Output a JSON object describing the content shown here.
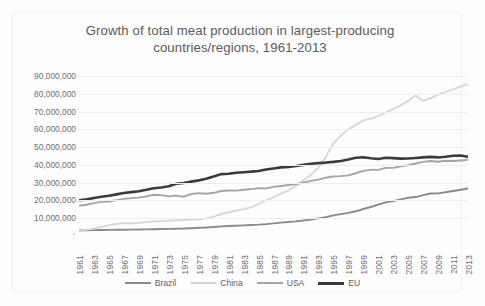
{
  "chart_data": {
    "type": "line",
    "title": "Growth of total meat production in largest-producing countries/regions, 1961-2013",
    "title_line1": "Growth of total meat production in largest-producing",
    "title_line2": "countries/regions, 1961-2013",
    "xlabel": "",
    "ylabel": "",
    "ylim": [
      0,
      90000000
    ],
    "xlim": [
      1961,
      2013
    ],
    "grid": true,
    "legend_position": "bottom",
    "y_ticks": [
      {
        "value": 90000000,
        "label": "90,000,000"
      },
      {
        "value": 80000000,
        "label": "80,000,000"
      },
      {
        "value": 70000000,
        "label": "70,000,000"
      },
      {
        "value": 60000000,
        "label": "60,000,000"
      },
      {
        "value": 50000000,
        "label": "50,000,000"
      },
      {
        "value": 40000000,
        "label": "40,000,000"
      },
      {
        "value": 30000000,
        "label": "30,000,000"
      },
      {
        "value": 20000000,
        "label": "20,000,000"
      },
      {
        "value": 10000000,
        "label": "10,000,000"
      }
    ],
    "x_tick_labels": [
      "1961",
      "1963",
      "1965",
      "1967",
      "1969",
      "1971",
      "1973",
      "1975",
      "1977",
      "1979",
      "1981",
      "1983",
      "1985",
      "1987",
      "1989",
      "1991",
      "1993",
      "1995",
      "1997",
      "1999",
      "2001",
      "2003",
      "2005",
      "2007",
      "2009",
      "2011",
      "2013"
    ],
    "x": [
      1961,
      1962,
      1963,
      1964,
      1965,
      1966,
      1967,
      1968,
      1969,
      1970,
      1971,
      1972,
      1973,
      1974,
      1975,
      1976,
      1977,
      1978,
      1979,
      1980,
      1981,
      1982,
      1983,
      1984,
      1985,
      1986,
      1987,
      1988,
      1989,
      1990,
      1991,
      1992,
      1993,
      1994,
      1995,
      1996,
      1997,
      1998,
      1999,
      2000,
      2001,
      2002,
      2003,
      2004,
      2005,
      2006,
      2007,
      2008,
      2009,
      2010,
      2011,
      2012,
      2013
    ],
    "series": [
      {
        "name": "Brazil",
        "color": "#8a8a8a",
        "width": 1.9,
        "values": [
          3100000,
          3200000,
          3300000,
          3400000,
          3450000,
          3500000,
          3550000,
          3600000,
          3650000,
          3700000,
          3800000,
          3900000,
          4000000,
          4100000,
          4200000,
          4400000,
          4600000,
          4800000,
          5100000,
          5400000,
          5600000,
          5800000,
          6000000,
          6200000,
          6400000,
          6700000,
          7100000,
          7500000,
          7900000,
          8200000,
          8700000,
          9300000,
          9900000,
          10600000,
          11600000,
          12300000,
          13000000,
          13900000,
          15200000,
          16300000,
          17600000,
          18900000,
          19600000,
          20600000,
          21500000,
          21900000,
          23000000,
          23900000,
          24000000,
          24600000,
          25300000,
          26000000,
          26700000
        ]
      },
      {
        "name": "China",
        "color": "#d6d6d6",
        "width": 1.8,
        "values": [
          2900000,
          3400000,
          4200000,
          5100000,
          6100000,
          6800000,
          7200000,
          7100000,
          7400000,
          7800000,
          8200000,
          8400000,
          8600000,
          8800000,
          9000000,
          9200000,
          9400000,
          9900000,
          10900000,
          12300000,
          13400000,
          14300000,
          15100000,
          16000000,
          18000000,
          20000000,
          21700000,
          23800000,
          25600000,
          28200000,
          31400000,
          34500000,
          38500000,
          44500000,
          52000000,
          56500000,
          60000000,
          62500000,
          65000000,
          66000000,
          67500000,
          69500000,
          71500000,
          73500000,
          76000000,
          79000000,
          76000000,
          77500000,
          79500000,
          81000000,
          82500000,
          84000000,
          85500000
        ]
      },
      {
        "name": "USA",
        "color": "#a5a5a5",
        "width": 1.9,
        "values": [
          17000000,
          17600000,
          18500000,
          19200000,
          19400000,
          20100000,
          20900000,
          21300000,
          21600000,
          22300000,
          23200000,
          23000000,
          22300000,
          22700000,
          22100000,
          23600000,
          24100000,
          23800000,
          24300000,
          25300000,
          25600000,
          25500000,
          26000000,
          26400000,
          26900000,
          26800000,
          27600000,
          28100000,
          28700000,
          29200000,
          30000000,
          31000000,
          31700000,
          32800000,
          33500000,
          33700000,
          34100000,
          35300000,
          36600000,
          37300000,
          37200000,
          38300000,
          38300000,
          39200000,
          39800000,
          40800000,
          41700000,
          42200000,
          41800000,
          42300000,
          42200000,
          42500000,
          42800000
        ]
      },
      {
        "name": "EU",
        "color": "#3b3b3b",
        "width": 2.6,
        "values": [
          20100000,
          20600000,
          21400000,
          22100000,
          22600000,
          23400000,
          24200000,
          24700000,
          25200000,
          26000000,
          26900000,
          27300000,
          28000000,
          29400000,
          29800000,
          30600000,
          31300000,
          32200000,
          33500000,
          34800000,
          35000000,
          35600000,
          35900000,
          36200000,
          36600000,
          37400000,
          38000000,
          38600000,
          38900000,
          39400000,
          40000000,
          40600000,
          41000000,
          41300000,
          41700000,
          42200000,
          43000000,
          44000000,
          44300000,
          43700000,
          43300000,
          44000000,
          43800000,
          43500000,
          43600000,
          43900000,
          44200000,
          44500000,
          44200000,
          44600000,
          45100000,
          45300000,
          44600000
        ]
      }
    ]
  },
  "legend": {
    "items": [
      {
        "label": "Brazil",
        "color": "#8a8a8a",
        "width": 2
      },
      {
        "label": "China",
        "color": "#d6d6d6",
        "width": 2
      },
      {
        "label": "USA",
        "color": "#a5a5a5",
        "width": 2
      },
      {
        "label": "EU",
        "color": "#3b3b3b",
        "width": 3
      }
    ]
  }
}
